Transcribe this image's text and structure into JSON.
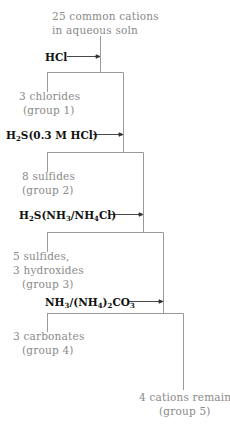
{
  "diagram": {
    "start": {
      "line1": "25 common cations",
      "line2": "in aqueous soln"
    },
    "steps": [
      {
        "reagent": "HCl",
        "precipitate": [
          "3 chlorides",
          "(group 1)"
        ]
      },
      {
        "reagent_main": "H",
        "reagent_sub1": "2",
        "reagent_rest": "S(0.3 M HCl)",
        "precipitate": [
          "8 sulfides",
          "(group 2)"
        ]
      },
      {
        "reagent_parts": [
          "H",
          "2",
          "S(NH",
          "3",
          "/NH",
          "4",
          "Cl)"
        ],
        "precipitate": [
          "5 sulfides,",
          "3 hydroxides",
          "(group 3)"
        ]
      },
      {
        "reagent_parts": [
          "NH",
          "3",
          "/(NH",
          "4",
          ")",
          "2",
          "CO",
          "3"
        ],
        "precipitate": [
          "3 carbonates",
          "(group 4)"
        ]
      }
    ],
    "end": {
      "line1": "4 cations remain",
      "line2": "(group 5)"
    },
    "colors": {
      "line": "#9a9a9a",
      "label": "#8a8a8a",
      "reagent": "#111111"
    }
  }
}
